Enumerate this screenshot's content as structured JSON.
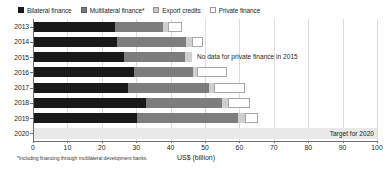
{
  "legend": {
    "items": [
      {
        "label": "Bilateral finance",
        "swatch": "square-filled-black-icon",
        "color": "#191919"
      },
      {
        "label": "Multilateral finance*",
        "swatch": "square-filled-gray-icon",
        "color": "#7d7d7d"
      },
      {
        "label": "Export credits",
        "swatch": "square-light-gray-icon",
        "color": "#cfcfcf"
      },
      {
        "label": "Private finance",
        "swatch": "square-outline-white-icon",
        "color": "#ffffff"
      }
    ]
  },
  "axis_title": "US$ (billion)",
  "footnote": "*Including financing through multilateral development banks.",
  "annotations": {
    "no_data_2015": "No data for private finance in 2015",
    "target_2020": "Target for 2020"
  },
  "chart_data": {
    "type": "bar",
    "orientation": "horizontal",
    "stacked": true,
    "title": "",
    "subtitle": "",
    "xlabel": "US$ (billion)",
    "ylabel": "",
    "xlim": [
      0,
      100
    ],
    "xticks": [
      0,
      10,
      20,
      30,
      40,
      50,
      60,
      70,
      80,
      90,
      100
    ],
    "xtick_labels": [
      "0",
      "10",
      "20",
      "30",
      "40",
      "50",
      "60",
      "70",
      "80",
      "90",
      "100"
    ],
    "categories": [
      "2013",
      "2014",
      "2015",
      "2016",
      "2017",
      "2018",
      "2019",
      "2020"
    ],
    "grid": true,
    "grid_axis": "x",
    "legend_position": "top-left",
    "series": [
      {
        "name": "Bilateral finance",
        "values": [
          23.9,
          24.4,
          26.5,
          29.4,
          27.6,
          32.8,
          30.2,
          null
        ]
      },
      {
        "name": "Multilateral finance*",
        "values": [
          13.9,
          20.1,
          17.7,
          17.2,
          23.6,
          22.1,
          29.4,
          null
        ]
      },
      {
        "name": "Export credits",
        "values": [
          1.5,
          1.7,
          2.0,
          1.2,
          1.5,
          1.7,
          2.0,
          null
        ]
      },
      {
        "name": "Private finance",
        "values": [
          3.9,
          3.2,
          null,
          8.7,
          9.0,
          6.4,
          3.8,
          null
        ]
      }
    ],
    "totals": [
      43.2,
      49.4,
      46.2,
      56.5,
      61.7,
      63.0,
      65.4,
      100
    ],
    "target": {
      "category": "2020",
      "value": 100,
      "label": "Target for 2020"
    },
    "notes": [
      {
        "category": "2015",
        "text": "No data for private finance in 2015"
      }
    ]
  }
}
